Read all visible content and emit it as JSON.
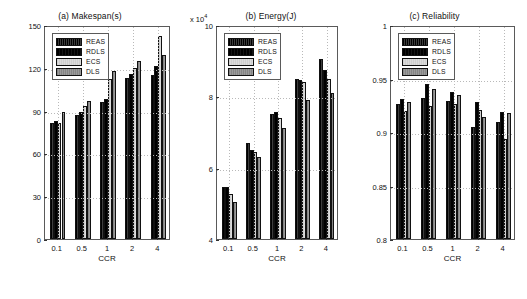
{
  "figure": {
    "xlabel": "CCR",
    "series_names": [
      "REAS",
      "RDLS",
      "ECS",
      "DLS"
    ],
    "categories": [
      "0.1",
      "0.5",
      "1",
      "2",
      "4"
    ]
  },
  "panels": [
    {
      "id": "a",
      "title": "(a) Makespan(s)",
      "multiplier": "",
      "yticks": [
        "0",
        "30",
        "60",
        "90",
        "120",
        "150"
      ]
    },
    {
      "id": "b",
      "title": "(b) Energy(J)",
      "multiplier": "x 10",
      "multiplier_exp": "4",
      "yticks": [
        "4",
        "6",
        "8",
        "10"
      ]
    },
    {
      "id": "c",
      "title": "(c) Reliability",
      "multiplier": "",
      "yticks": [
        "0.8",
        "0.85",
        "0.9",
        "0.95",
        "1"
      ]
    }
  ],
  "chart_data": [
    {
      "type": "bar",
      "title": "(a) Makespan(s)",
      "xlabel": "CCR",
      "ylabel": "",
      "categories": [
        "0.1",
        "0.5",
        "1",
        "2",
        "4"
      ],
      "ylim": [
        0,
        150
      ],
      "yticks": [
        0,
        30,
        60,
        90,
        120,
        150
      ],
      "grid": true,
      "legend_position": "upper-left",
      "series": [
        {
          "name": "REAS",
          "values": [
            81,
            87,
            96,
            113,
            115
          ]
        },
        {
          "name": "RDLS",
          "values": [
            83,
            89,
            98,
            116,
            121
          ]
        },
        {
          "name": "ECS",
          "values": [
            81,
            93,
            112,
            120,
            142
          ]
        },
        {
          "name": "DLS",
          "values": [
            89,
            97,
            118,
            125,
            129
          ]
        }
      ]
    },
    {
      "type": "bar",
      "title": "(b) Energy(J)",
      "xlabel": "CCR",
      "ylabel": "",
      "axis_multiplier": 10000,
      "categories": [
        "0.1",
        "0.5",
        "1",
        "2",
        "4"
      ],
      "ylim": [
        4,
        10
      ],
      "yticks": [
        4,
        6,
        8,
        10
      ],
      "grid": true,
      "legend_position": "upper-left",
      "series": [
        {
          "name": "REAS",
          "values": [
            5.45,
            6.7,
            7.5,
            8.5,
            9.05
          ]
        },
        {
          "name": "RDLS",
          "values": [
            5.45,
            6.5,
            7.55,
            8.45,
            8.75
          ]
        },
        {
          "name": "ECS",
          "values": [
            5.25,
            6.45,
            7.4,
            8.4,
            8.5
          ]
        },
        {
          "name": "DLS",
          "values": [
            5.05,
            6.3,
            7.1,
            7.9,
            8.1
          ]
        }
      ]
    },
    {
      "type": "bar",
      "title": "(c) Reliability",
      "xlabel": "CCR",
      "ylabel": "",
      "categories": [
        "0.1",
        "0.5",
        "1",
        "2",
        "4"
      ],
      "ylim": [
        0.8,
        1.0
      ],
      "yticks": [
        0.8,
        0.85,
        0.9,
        0.95,
        1
      ],
      "grid": true,
      "legend_position": "upper-left",
      "series": [
        {
          "name": "REAS",
          "values": [
            0.9265,
            0.9315,
            0.929,
            0.9045,
            0.909
          ]
        },
        {
          "name": "RDLS",
          "values": [
            0.9305,
            0.9445,
            0.9375,
            0.9285,
            0.9185
          ]
        },
        {
          "name": "ECS",
          "values": [
            0.9195,
            0.9245,
            0.9265,
            0.9205,
            0.8935
          ]
        },
        {
          "name": "DLS",
          "values": [
            0.9285,
            0.9405,
            0.9345,
            0.9145,
            0.9175
          ]
        }
      ]
    }
  ]
}
